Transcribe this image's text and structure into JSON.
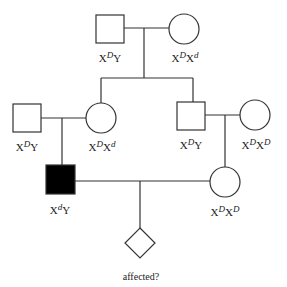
{
  "diagram": {
    "type": "pedigree",
    "colors": {
      "line": "#333333",
      "affected_fill": "#000000",
      "unaffected_fill": "#ffffff"
    },
    "generation1": {
      "father": {
        "shape": "square",
        "affected": false,
        "genotype": {
          "base1": "X",
          "sup1": "D",
          "base2": "Y",
          "sup2": ""
        }
      },
      "mother": {
        "shape": "circle",
        "affected": false,
        "genotype": {
          "base1": "X",
          "sup1": "D",
          "base2": "X",
          "sup2": "d"
        }
      }
    },
    "generation2": {
      "left_husband": {
        "shape": "square",
        "affected": false,
        "genotype": {
          "base1": "X",
          "sup1": "D",
          "base2": "Y",
          "sup2": ""
        }
      },
      "left_daughter": {
        "shape": "circle",
        "affected": false,
        "genotype": {
          "base1": "X",
          "sup1": "D",
          "base2": "X",
          "sup2": "d"
        }
      },
      "right_son": {
        "shape": "square",
        "affected": false,
        "genotype": {
          "base1": "X",
          "sup1": "D",
          "base2": "Y",
          "sup2": ""
        }
      },
      "right_wife": {
        "shape": "circle",
        "affected": false,
        "genotype": {
          "base1": "X",
          "sup1": "D",
          "base2": "X",
          "sup2": "D"
        }
      }
    },
    "generation3": {
      "affected_male": {
        "shape": "square",
        "affected": true,
        "genotype": {
          "base1": "X",
          "sup1": "d",
          "base2": "Y",
          "sup2": ""
        }
      },
      "female": {
        "shape": "circle",
        "affected": false,
        "genotype": {
          "base1": "X",
          "sup1": "D",
          "base2": "X",
          "sup2": "D"
        }
      }
    },
    "generation4": {
      "child": {
        "shape": "diamond",
        "affected": null,
        "caption": "affected?"
      }
    }
  }
}
